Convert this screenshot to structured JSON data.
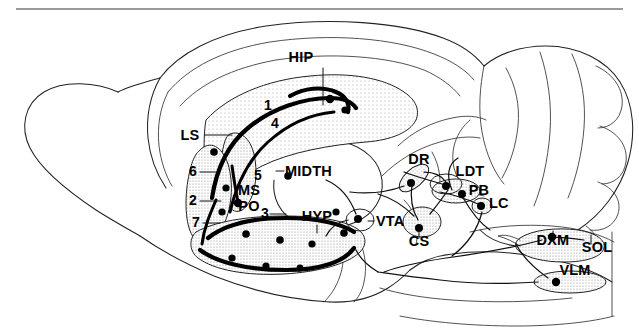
{
  "figure": {
    "background_color": "#ffffff",
    "ink_color": "#000000",
    "rule_color": "#9a9a9a",
    "stipple_color": "#cfcfcf"
  },
  "labels": {
    "hip": "HIP",
    "ls": "LS",
    "midth": "MIDTH",
    "ms": "MS",
    "po": "PO",
    "hyp": "HYP",
    "vta": "VTA",
    "dr": "DR",
    "ldt": "LDT",
    "pb": "PB",
    "lc": "LC",
    "cs": "CS",
    "dxm": "DXM",
    "sol": "SOL",
    "vlm": "VLM"
  },
  "numbers": {
    "n1": "1",
    "n2": "2",
    "n3": "3",
    "n4": "4",
    "n5": "5",
    "n6": "6",
    "n7": "7"
  },
  "label_list": [
    {
      "key": "hip",
      "text": "HIP",
      "x": 301,
      "y": 62,
      "anchor": "middle",
      "leader": "M 323 68 L 323 105"
    },
    {
      "key": "ls",
      "text": "LS",
      "x": 190,
      "y": 140,
      "anchor": "middle",
      "leader": "M 205 135 L 232 135"
    },
    {
      "key": "midth",
      "text": "MIDTH",
      "x": 285,
      "y": 176,
      "anchor": "start",
      "leader": "M 276 171 L 284 171"
    },
    {
      "key": "ms",
      "text": "MS",
      "x": 249,
      "y": 195,
      "anchor": "middle",
      "leader": ""
    },
    {
      "key": "po",
      "text": "PO",
      "x": 249,
      "y": 211,
      "anchor": "middle",
      "leader": ""
    },
    {
      "key": "hyp",
      "text": "HYP",
      "x": 317,
      "y": 221,
      "anchor": "middle",
      "leader": "M 317 225 L 317 233"
    },
    {
      "key": "vta",
      "text": "VTA",
      "x": 376,
      "y": 226,
      "anchor": "start",
      "leader": "M 368 221 L 374 221"
    },
    {
      "key": "dr",
      "text": "DR",
      "x": 419,
      "y": 164,
      "anchor": "middle",
      "leader": ""
    },
    {
      "key": "ldt",
      "text": "LDT",
      "x": 470,
      "y": 176,
      "anchor": "middle",
      "leader": ""
    },
    {
      "key": "pb",
      "text": "PB",
      "x": 479,
      "y": 195,
      "anchor": "middle",
      "leader": ""
    },
    {
      "key": "lc",
      "text": "LC",
      "x": 489,
      "y": 208,
      "anchor": "start",
      "leader": ""
    },
    {
      "key": "cs",
      "text": "CS",
      "x": 419,
      "y": 246,
      "anchor": "middle",
      "leader": "M 419 238 L 419 231"
    },
    {
      "key": "dxm",
      "text": "DXM",
      "x": 553,
      "y": 245,
      "anchor": "middle",
      "leader": "M 553 236 L 553 231"
    },
    {
      "key": "sol",
      "text": "SOL",
      "x": 597,
      "y": 252,
      "anchor": "middle",
      "leader": "M 591 244 L 591 235"
    },
    {
      "key": "vlm",
      "text": "VLM",
      "x": 575,
      "y": 275,
      "anchor": "middle",
      "leader": ""
    }
  ],
  "number_list": [
    {
      "key": "n1",
      "text": "1",
      "x": 268,
      "y": 110,
      "anchor": "middle",
      "leader": ""
    },
    {
      "key": "n4",
      "text": "4",
      "x": 275,
      "y": 128,
      "anchor": "middle",
      "leader": ""
    },
    {
      "key": "n6",
      "text": "6",
      "x": 193,
      "y": 176,
      "anchor": "middle",
      "leader": "M 200 172 L 218 172"
    },
    {
      "key": "n5",
      "text": "5",
      "x": 258,
      "y": 180,
      "anchor": "middle",
      "leader": ""
    },
    {
      "key": "n2",
      "text": "2",
      "x": 193,
      "y": 205,
      "anchor": "middle",
      "leader": "M 200 201 L 221 201"
    },
    {
      "key": "n3",
      "text": "3",
      "x": 265,
      "y": 218,
      "anchor": "middle",
      "leader": "M 270 214 L 286 214"
    },
    {
      "key": "n7",
      "text": "7",
      "x": 196,
      "y": 227,
      "anchor": "middle",
      "leader": "M 203 223 L 220 223"
    }
  ]
}
